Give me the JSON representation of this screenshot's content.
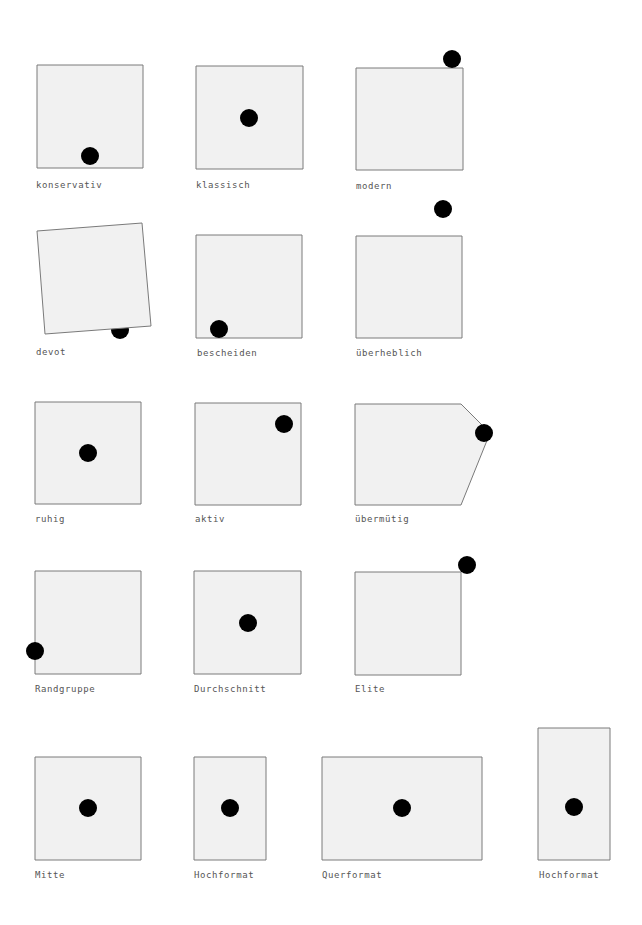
{
  "colors": {
    "background": "#ffffff",
    "shape_fill": "#f1f1f1",
    "shape_stroke": "#7a7a7a",
    "dot": "#000000",
    "label": "#555555"
  },
  "dot_radius": 9,
  "items": [
    {
      "label": "konservativ",
      "shape": [
        [
          37,
          65
        ],
        [
          143,
          65
        ],
        [
          143,
          168
        ],
        [
          37,
          168
        ]
      ],
      "dot": [
        90,
        156
      ],
      "dot_behind": false,
      "label_pos": [
        36,
        180
      ]
    },
    {
      "label": "klassisch",
      "shape": [
        [
          196,
          66
        ],
        [
          303,
          66
        ],
        [
          303,
          169
        ],
        [
          196,
          169
        ]
      ],
      "dot": [
        249,
        118
      ],
      "dot_behind": false,
      "label_pos": [
        196,
        180
      ]
    },
    {
      "label": "modern",
      "shape": [
        [
          356,
          68
        ],
        [
          463,
          68
        ],
        [
          463,
          170
        ],
        [
          356,
          170
        ]
      ],
      "dot": [
        452,
        59
      ],
      "dot_behind": false,
      "label_pos": [
        356,
        181
      ]
    },
    {
      "label": "devot",
      "shape": [
        [
          37,
          231
        ],
        [
          142,
          223
        ],
        [
          151,
          326
        ],
        [
          45,
          334
        ]
      ],
      "dot": [
        120,
        330
      ],
      "dot_behind": true,
      "label_pos": [
        36,
        347
      ]
    },
    {
      "label": "bescheiden",
      "shape": [
        [
          196,
          235
        ],
        [
          302,
          235
        ],
        [
          302,
          338
        ],
        [
          196,
          338
        ]
      ],
      "dot": [
        219,
        329
      ],
      "dot_behind": false,
      "label_pos": [
        197,
        348
      ]
    },
    {
      "label": "überheblich",
      "shape": [
        [
          356,
          236
        ],
        [
          462,
          236
        ],
        [
          462,
          338
        ],
        [
          356,
          338
        ]
      ],
      "dot": [
        443,
        209
      ],
      "dot_behind": false,
      "label_pos": [
        356,
        348
      ]
    },
    {
      "label": "ruhig",
      "shape": [
        [
          35,
          402
        ],
        [
          141,
          402
        ],
        [
          141,
          504
        ],
        [
          35,
          504
        ]
      ],
      "dot": [
        88,
        453
      ],
      "dot_behind": false,
      "label_pos": [
        35,
        514
      ]
    },
    {
      "label": "aktiv",
      "shape": [
        [
          195,
          403
        ],
        [
          301,
          403
        ],
        [
          301,
          505
        ],
        [
          195,
          505
        ]
      ],
      "dot": [
        284,
        424
      ],
      "dot_behind": false,
      "label_pos": [
        195,
        514
      ]
    },
    {
      "label": "übermütig",
      "shape": [
        [
          355,
          404
        ],
        [
          461,
          404
        ],
        [
          490,
          433
        ],
        [
          461,
          505
        ],
        [
          355,
          505
        ]
      ],
      "dot": [
        484,
        433
      ],
      "dot_behind": false,
      "label_pos": [
        355,
        514
      ]
    },
    {
      "label": "Randgruppe",
      "shape": [
        [
          35,
          571
        ],
        [
          141,
          571
        ],
        [
          141,
          674
        ],
        [
          35,
          674
        ]
      ],
      "dot": [
        35,
        651
      ],
      "dot_behind": false,
      "label_pos": [
        35,
        684
      ]
    },
    {
      "label": "Durchschnitt",
      "shape": [
        [
          194,
          571
        ],
        [
          301,
          571
        ],
        [
          301,
          674
        ],
        [
          194,
          674
        ]
      ],
      "dot": [
        248,
        623
      ],
      "dot_behind": false,
      "label_pos": [
        194,
        684
      ]
    },
    {
      "label": "Elite",
      "shape": [
        [
          355,
          572
        ],
        [
          461,
          572
        ],
        [
          461,
          675
        ],
        [
          355,
          675
        ]
      ],
      "dot": [
        467,
        565
      ],
      "dot_behind": false,
      "label_pos": [
        355,
        684
      ]
    },
    {
      "label": "Mitte",
      "shape": [
        [
          35,
          757
        ],
        [
          141,
          757
        ],
        [
          141,
          860
        ],
        [
          35,
          860
        ]
      ],
      "dot": [
        88,
        808
      ],
      "dot_behind": false,
      "label_pos": [
        35,
        870
      ]
    },
    {
      "label": "Hochformat",
      "shape": [
        [
          194,
          757
        ],
        [
          266,
          757
        ],
        [
          266,
          860
        ],
        [
          194,
          860
        ]
      ],
      "dot": [
        230,
        808
      ],
      "dot_behind": false,
      "label_pos": [
        194,
        870
      ]
    },
    {
      "label": "Querformat",
      "shape": [
        [
          322,
          757
        ],
        [
          482,
          757
        ],
        [
          482,
          860
        ],
        [
          322,
          860
        ]
      ],
      "dot": [
        402,
        808
      ],
      "dot_behind": false,
      "label_pos": [
        322,
        870
      ]
    },
    {
      "label": "Hochformat",
      "shape": [
        [
          538,
          728
        ],
        [
          610,
          728
        ],
        [
          610,
          860
        ],
        [
          538,
          860
        ]
      ],
      "dot": [
        574,
        807
      ],
      "dot_behind": false,
      "label_pos": [
        539,
        870
      ]
    }
  ]
}
